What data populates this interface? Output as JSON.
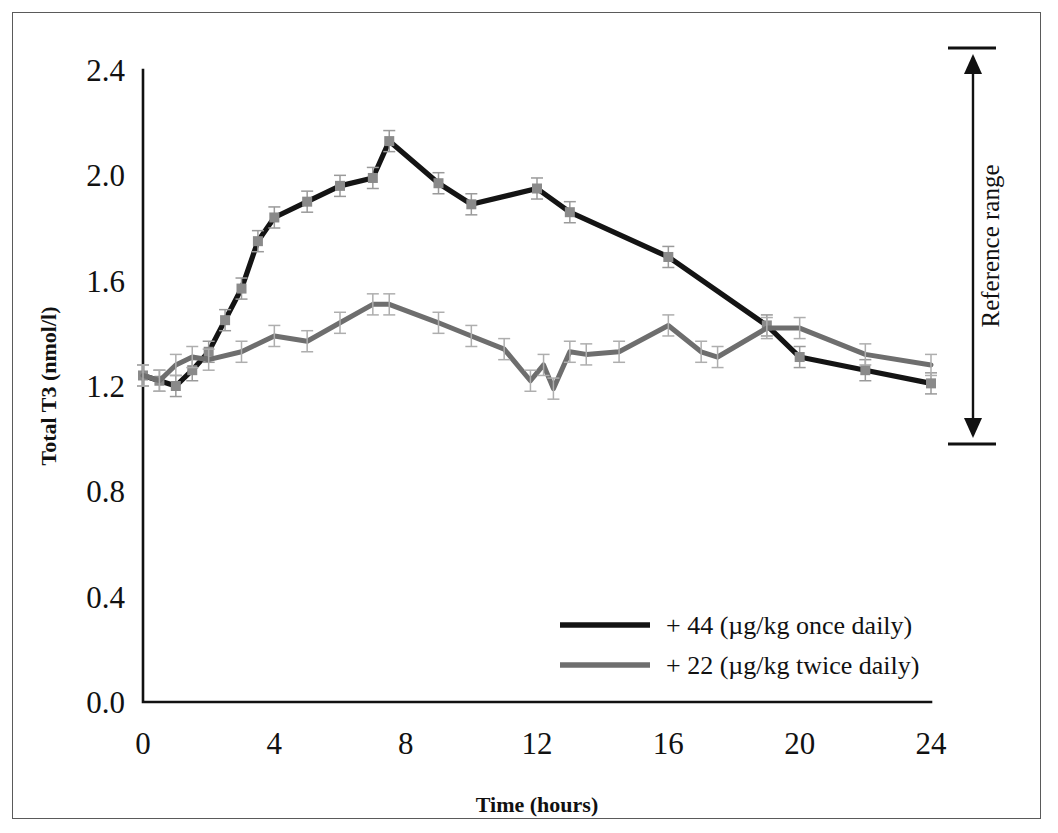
{
  "figure": {
    "background_color": "#ffffff",
    "border_color": "#5a5a5a"
  },
  "annotation": {
    "reference_range_label": "Reference range"
  },
  "chart_data": {
    "type": "line",
    "title": "",
    "xlabel": "Time (hours)",
    "ylabel": "Total T3  (nmol/l)",
    "xlim": [
      0,
      24
    ],
    "ylim": [
      0.0,
      2.4
    ],
    "xticks": [
      0,
      4,
      8,
      12,
      16,
      20,
      24
    ],
    "xtick_labels": [
      "0",
      "4",
      "8",
      "12",
      "16",
      "20",
      "24"
    ],
    "yticks": [
      0.0,
      0.4,
      0.8,
      1.2,
      1.6,
      2.0,
      2.4
    ],
    "ytick_labels": [
      "0.0",
      "0.4",
      "0.8",
      "1.2",
      "1.6",
      "2.0",
      "2.4"
    ],
    "grid": false,
    "legend_position": "lower-center-right",
    "error_bars": true,
    "series": [
      {
        "name": "+ 44 (µg/kg once daily)",
        "color": "#141414",
        "marker": "square",
        "marker_color": "#8a8a8a",
        "x": [
          0,
          0.5,
          1,
          1.5,
          2,
          2.5,
          3,
          3.5,
          4,
          5,
          6,
          7,
          7.5,
          9,
          10,
          12,
          13,
          16,
          19,
          20,
          22,
          24
        ],
        "y": [
          1.24,
          1.22,
          1.2,
          1.26,
          1.33,
          1.45,
          1.57,
          1.75,
          1.84,
          1.9,
          1.96,
          1.99,
          2.13,
          1.97,
          1.89,
          1.95,
          1.86,
          1.69,
          1.43,
          1.31,
          1.26,
          1.21
        ],
        "yerr": [
          0.04,
          0.04,
          0.04,
          0.04,
          0.04,
          0.04,
          0.04,
          0.04,
          0.04,
          0.04,
          0.04,
          0.04,
          0.04,
          0.04,
          0.04,
          0.04,
          0.04,
          0.04,
          0.04,
          0.04,
          0.04,
          0.04
        ]
      },
      {
        "name": "+ 22 (µg/kg twice daily)",
        "color": "#6e6e6e",
        "marker": "tick",
        "marker_color": "#aeaeae",
        "x": [
          0,
          0.5,
          1,
          1.5,
          2,
          3,
          4,
          5,
          6,
          7,
          7.5,
          9,
          10,
          11,
          11.8,
          12.2,
          12.5,
          13,
          13.5,
          14.5,
          16,
          17,
          17.5,
          19,
          20,
          22,
          24
        ],
        "y": [
          1.24,
          1.22,
          1.28,
          1.31,
          1.3,
          1.33,
          1.39,
          1.37,
          1.44,
          1.51,
          1.51,
          1.44,
          1.39,
          1.34,
          1.22,
          1.28,
          1.19,
          1.33,
          1.32,
          1.33,
          1.43,
          1.33,
          1.31,
          1.42,
          1.42,
          1.32,
          1.28
        ],
        "yerr": [
          0.04,
          0.04,
          0.04,
          0.04,
          0.04,
          0.04,
          0.04,
          0.04,
          0.04,
          0.04,
          0.04,
          0.04,
          0.04,
          0.04,
          0.04,
          0.04,
          0.04,
          0.04,
          0.04,
          0.04,
          0.04,
          0.04,
          0.04,
          0.04,
          0.04,
          0.04,
          0.04
        ]
      }
    ]
  }
}
